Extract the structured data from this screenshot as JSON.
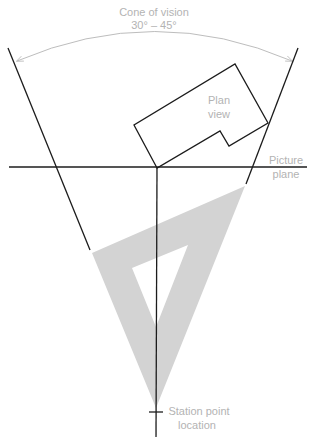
{
  "diagram": {
    "title": "Cone of vision",
    "cone_angle_label": "30° – 45°",
    "labels": {
      "plan_view_line1": "Plan",
      "plan_view_line2": "view",
      "picture_plane_line1": "Picture",
      "picture_plane_line2": "plane",
      "station_point_line1": "Station point",
      "station_point_line2": "location"
    },
    "colors": {
      "line": "#1c1c1c",
      "annotation": "#b3b3b3",
      "triangle_fill": "#d3d3d3",
      "background": "#ffffff"
    },
    "elements": [
      "cone-of-vision-arc",
      "left-sight-line",
      "right-sight-line",
      "plan-view-outline",
      "picture-plane-line",
      "center-line-of-vision",
      "triangle-drafting-tool",
      "station-point-tick"
    ]
  }
}
